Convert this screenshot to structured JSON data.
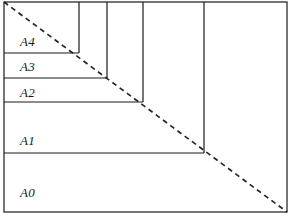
{
  "figure": {
    "name": "iso-a-series-paper-size-nesting-diagram",
    "colors": {
      "background": "#ffffff",
      "stroke": "#1a1a1a",
      "label_text": "#1a1a1a",
      "dashed_line": "#262626"
    },
    "canvas": {
      "width": 291,
      "height": 221
    }
  },
  "chart_data": {
    "type": "diagram",
    "title": "",
    "xlabel": "",
    "ylabel": "",
    "outer_frame": {
      "x": 4,
      "y": 2,
      "width": 283,
      "height": 210
    },
    "diagonal": {
      "style": "dashed",
      "from": {
        "x": 4,
        "y": 2
      },
      "to": {
        "x": 287,
        "y": 212
      }
    },
    "rectangles": [
      {
        "label": "A0",
        "x": 4,
        "y": 2,
        "width": 283,
        "height": 210,
        "right": 287,
        "bottom": 212
      },
      {
        "label": "A1",
        "x": 4,
        "y": 2,
        "width": 200,
        "height": 151,
        "right": 204,
        "bottom": 153
      },
      {
        "label": "A2",
        "x": 4,
        "y": 2,
        "width": 139,
        "height": 100,
        "right": 143,
        "bottom": 102
      },
      {
        "label": "A3",
        "x": 4,
        "y": 2,
        "width": 103,
        "height": 76,
        "right": 107,
        "bottom": 78
      },
      {
        "label": "A4",
        "x": 4,
        "y": 2,
        "width": 75,
        "height": 51,
        "right": 79,
        "bottom": 53
      }
    ],
    "labels": [
      {
        "text": "A4",
        "x": 20,
        "y": 35
      },
      {
        "text": "A3",
        "x": 20,
        "y": 60
      },
      {
        "text": "A2",
        "x": 20,
        "y": 86
      },
      {
        "text": "A1",
        "x": 20,
        "y": 134
      },
      {
        "text": "A0",
        "x": 20,
        "y": 186
      }
    ]
  }
}
